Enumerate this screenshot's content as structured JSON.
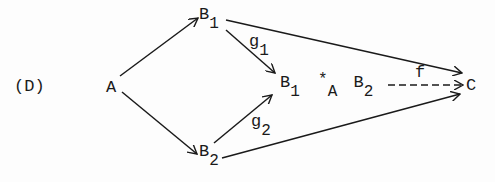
{
  "diagram": {
    "label": "(D)",
    "nodes": {
      "A": "A",
      "B1": {
        "base": "B",
        "sub": "1"
      },
      "B2": {
        "base": "B",
        "sub": "2"
      },
      "pushout": {
        "left_base": "B",
        "left_sub": "1",
        "op": "*",
        "op_sub": "A",
        "right_base": "B",
        "right_sub": "2"
      },
      "C": "C"
    },
    "edges": {
      "g1": {
        "base": "g",
        "sub": "1"
      },
      "g2": {
        "base": "g",
        "sub": "2"
      },
      "f": "f"
    },
    "colors": {
      "ink": "#1a1a1a",
      "background": "#fdfdfd"
    }
  }
}
